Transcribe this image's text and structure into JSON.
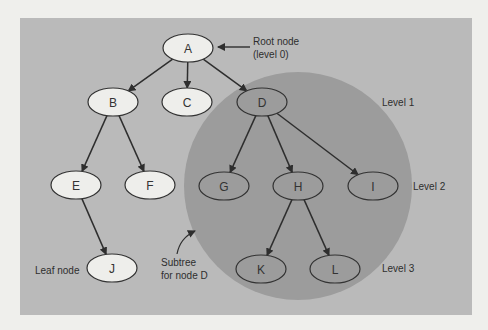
{
  "diagram": {
    "colors": {
      "page_bg": "#efefec",
      "panel_bg": "#bababa",
      "subtree_bg": "#9c9c9c",
      "node_light": "#eeeeeb",
      "node_dark": "#9c9c9c",
      "stroke": "#333333"
    },
    "nodes": [
      {
        "id": "A",
        "label": "A",
        "cx": 188,
        "cy": 48,
        "in_subtree": false
      },
      {
        "id": "B",
        "label": "B",
        "cx": 113,
        "cy": 102,
        "in_subtree": false
      },
      {
        "id": "C",
        "label": "C",
        "cx": 187,
        "cy": 102,
        "in_subtree": false
      },
      {
        "id": "D",
        "label": "D",
        "cx": 262,
        "cy": 102,
        "in_subtree": true
      },
      {
        "id": "E",
        "label": "E",
        "cx": 76,
        "cy": 185,
        "in_subtree": false
      },
      {
        "id": "F",
        "label": "F",
        "cx": 150,
        "cy": 185,
        "in_subtree": false
      },
      {
        "id": "G",
        "label": "G",
        "cx": 224,
        "cy": 186,
        "in_subtree": true
      },
      {
        "id": "H",
        "label": "H",
        "cx": 298,
        "cy": 186,
        "in_subtree": true
      },
      {
        "id": "I",
        "label": "I",
        "cx": 373,
        "cy": 186,
        "in_subtree": true
      },
      {
        "id": "J",
        "label": "J",
        "cx": 112,
        "cy": 268,
        "in_subtree": false
      },
      {
        "id": "K",
        "label": "K",
        "cx": 261,
        "cy": 269,
        "in_subtree": true
      },
      {
        "id": "L",
        "label": "L",
        "cx": 335,
        "cy": 269,
        "in_subtree": true
      }
    ],
    "edges": [
      [
        "A",
        "B"
      ],
      [
        "A",
        "C"
      ],
      [
        "A",
        "D"
      ],
      [
        "B",
        "E"
      ],
      [
        "B",
        "F"
      ],
      [
        "D",
        "G"
      ],
      [
        "D",
        "H"
      ],
      [
        "D",
        "I"
      ],
      [
        "E",
        "J"
      ],
      [
        "H",
        "K"
      ],
      [
        "H",
        "L"
      ]
    ],
    "labels": {
      "root_line1": "Root node",
      "root_line2": "(level 0)",
      "level1": "Level 1",
      "level2": "Level 2",
      "level3": "Level 3",
      "leaf": "Leaf node",
      "subtree_line1": "Subtree",
      "subtree_line2": "for node D"
    }
  }
}
